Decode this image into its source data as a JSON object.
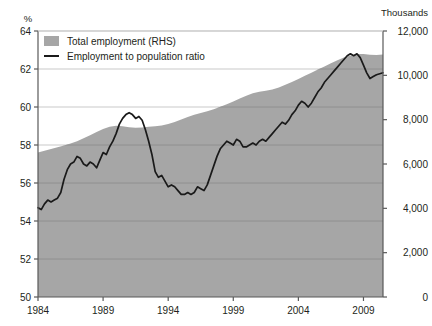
{
  "chart_data": {
    "type": "line",
    "title": "",
    "subtitle": "",
    "xlabel": "",
    "ylabel": "%",
    "y2label": "Thousands",
    "grid": true,
    "legend_position": "top-left",
    "xlim": [
      1984,
      2010.5
    ],
    "ylim": [
      50,
      64
    ],
    "y2lim": [
      0,
      12000
    ],
    "xticks": [
      1984,
      1989,
      1994,
      1999,
      2004,
      2009
    ],
    "xticklabels": [
      "1984",
      "1989",
      "1994",
      "1999",
      "2004",
      "2009"
    ],
    "yticks": [
      50,
      52,
      54,
      56,
      58,
      60,
      62,
      64
    ],
    "yticklabels": [
      "50",
      "52",
      "54",
      "56",
      "58",
      "60",
      "62",
      "64"
    ],
    "y2ticks": [
      0,
      2000,
      4000,
      6000,
      8000,
      10000,
      12000
    ],
    "y2ticklabels": [
      "0",
      "2,000",
      "4,000",
      "6,000",
      "8,000",
      "10,000",
      "12,000"
    ],
    "colors": {
      "area_fill": "#a6a6a6",
      "line": "#1a1a1a",
      "grid": "#8c8c8c",
      "grid_above_fill": "#c9c9c9",
      "axis": "#595959",
      "background": "#ffffff"
    },
    "series": [
      {
        "name": "Total employment (RHS)",
        "type": "area",
        "axis": "right",
        "units": "Thousands",
        "x": [
          1984.0,
          1984.5,
          1985.0,
          1985.5,
          1986.0,
          1986.5,
          1987.0,
          1987.5,
          1988.0,
          1988.5,
          1989.0,
          1989.5,
          1990.0,
          1990.5,
          1991.0,
          1991.5,
          1992.0,
          1992.5,
          1993.0,
          1993.5,
          1994.0,
          1994.5,
          1995.0,
          1995.5,
          1996.0,
          1996.5,
          1997.0,
          1997.5,
          1998.0,
          1998.5,
          1999.0,
          1999.5,
          2000.0,
          2000.5,
          2001.0,
          2001.5,
          2002.0,
          2002.5,
          2003.0,
          2003.5,
          2004.0,
          2004.5,
          2005.0,
          2005.5,
          2006.0,
          2006.5,
          2007.0,
          2007.5,
          2008.0,
          2008.5,
          2009.0,
          2009.5,
          2010.0,
          2010.5
        ],
        "values": [
          6520,
          6600,
          6680,
          6760,
          6840,
          6930,
          7030,
          7160,
          7300,
          7440,
          7580,
          7680,
          7720,
          7700,
          7660,
          7640,
          7650,
          7680,
          7700,
          7740,
          7800,
          7900,
          8010,
          8120,
          8220,
          8300,
          8380,
          8470,
          8580,
          8700,
          8820,
          8950,
          9080,
          9190,
          9260,
          9300,
          9360,
          9450,
          9570,
          9700,
          9840,
          9980,
          10120,
          10260,
          10400,
          10540,
          10680,
          10800,
          10900,
          10960,
          10960,
          10930,
          10920,
          10940
        ]
      },
      {
        "name": "Employment to population ratio",
        "type": "line",
        "axis": "left",
        "units": "%",
        "x": [
          1984.0,
          1984.25,
          1984.5,
          1984.75,
          1985.0,
          1985.25,
          1985.5,
          1985.75,
          1986.0,
          1986.25,
          1986.5,
          1986.75,
          1987.0,
          1987.25,
          1987.5,
          1987.75,
          1988.0,
          1988.25,
          1988.5,
          1988.75,
          1989.0,
          1989.25,
          1989.5,
          1989.75,
          1990.0,
          1990.25,
          1990.5,
          1990.75,
          1991.0,
          1991.25,
          1991.5,
          1991.75,
          1992.0,
          1992.25,
          1992.5,
          1992.75,
          1993.0,
          1993.25,
          1993.5,
          1993.75,
          1994.0,
          1994.25,
          1994.5,
          1994.75,
          1995.0,
          1995.25,
          1995.5,
          1995.75,
          1996.0,
          1996.25,
          1996.5,
          1996.75,
          1997.0,
          1997.25,
          1997.5,
          1997.75,
          1998.0,
          1998.25,
          1998.5,
          1998.75,
          1999.0,
          1999.25,
          1999.5,
          1999.75,
          2000.0,
          2000.25,
          2000.5,
          2000.75,
          2001.0,
          2001.25,
          2001.5,
          2001.75,
          2002.0,
          2002.25,
          2002.5,
          2002.75,
          2003.0,
          2003.25,
          2003.5,
          2003.75,
          2004.0,
          2004.25,
          2004.5,
          2004.75,
          2005.0,
          2005.25,
          2005.5,
          2005.75,
          2006.0,
          2006.25,
          2006.5,
          2006.75,
          2007.0,
          2007.25,
          2007.5,
          2007.75,
          2008.0,
          2008.25,
          2008.5,
          2008.75,
          2009.0,
          2009.25,
          2009.5,
          2009.75,
          2010.0,
          2010.5
        ],
        "values": [
          54.7,
          54.6,
          54.9,
          55.1,
          55.0,
          55.1,
          55.2,
          55.5,
          56.2,
          56.7,
          57.0,
          57.1,
          57.4,
          57.3,
          57.0,
          56.9,
          57.1,
          57.0,
          56.8,
          57.2,
          57.6,
          57.5,
          57.9,
          58.2,
          58.6,
          59.1,
          59.4,
          59.6,
          59.7,
          59.6,
          59.4,
          59.5,
          59.3,
          58.8,
          58.2,
          57.5,
          56.6,
          56.3,
          56.4,
          56.1,
          55.8,
          55.9,
          55.8,
          55.6,
          55.4,
          55.4,
          55.5,
          55.4,
          55.5,
          55.8,
          55.7,
          55.6,
          55.9,
          56.4,
          56.9,
          57.4,
          57.8,
          58.0,
          58.2,
          58.1,
          58.0,
          58.3,
          58.2,
          57.9,
          57.9,
          58.0,
          58.1,
          58.0,
          58.2,
          58.3,
          58.2,
          58.4,
          58.6,
          58.8,
          59.0,
          59.2,
          59.1,
          59.3,
          59.6,
          59.8,
          60.1,
          60.3,
          60.2,
          60.0,
          60.2,
          60.5,
          60.8,
          61.0,
          61.3,
          61.5,
          61.7,
          61.9,
          62.1,
          62.3,
          62.5,
          62.7,
          62.8,
          62.7,
          62.8,
          62.6,
          62.2,
          61.8,
          61.5,
          61.6,
          61.7,
          61.8
        ]
      }
    ],
    "legend": [
      {
        "label": "Total employment (RHS)",
        "marker": "swatch",
        "color": "#a6a6a6"
      },
      {
        "label": "Employment to population ratio",
        "marker": "line",
        "color": "#1a1a1a"
      }
    ]
  }
}
